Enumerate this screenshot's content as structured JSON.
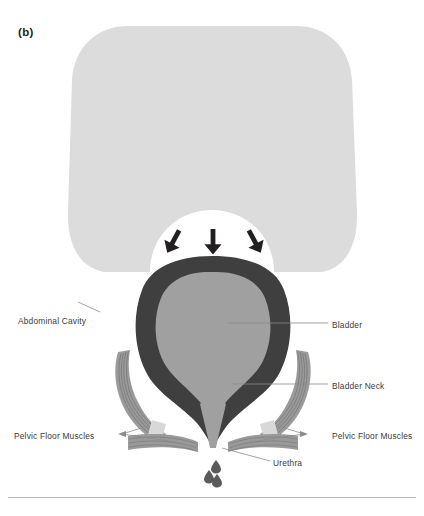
{
  "figure": {
    "panel_label": "(b)",
    "background_color": "#ffffff",
    "width": 424,
    "height": 516
  },
  "labels": {
    "abdominal_cavity": "Abdominal Cavity",
    "bladder": "Bladder",
    "bladder_neck": "Bladder Neck",
    "pelvic_floor_muscles_left": "Pelvic Floor Muscles",
    "pelvic_floor_muscles_right": "Pelvic Floor Muscles",
    "urethra": "Urethra"
  },
  "icons": {
    "pressure_arrow_left": "arrow-down-right-icon",
    "pressure_arrow_center": "arrow-down-icon",
    "pressure_arrow_right": "arrow-down-left-icon",
    "urine_droplets": "droplet-icon"
  },
  "colors": {
    "abdominal_cavity_fill": "#dcdcdc",
    "bladder_wall_fill": "#3f3f3f",
    "bladder_lumen_fill": "#a0a0a0",
    "urethra_fill": "#a0a0a0",
    "muscle_fill": "#9a9a9a",
    "muscle_stripe": "#6e6e6e",
    "tendon_fill": "#d8d8d8",
    "arrow_fill": "#231f20",
    "droplet_fill": "#5a5a5a",
    "leader_line": "#8c8c8c",
    "label_text": "#3b3b3b",
    "rule": "#b9b9b9"
  },
  "annotations": {
    "pressure_arrow_count": 3,
    "droplet_count": 3,
    "pelvic_floor_leader_targets_per_side": 2
  }
}
